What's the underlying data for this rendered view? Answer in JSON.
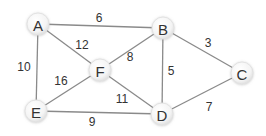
{
  "graph": {
    "type": "undirected-weighted",
    "nodes": [
      {
        "id": "A",
        "label": "A",
        "x": 38,
        "y": 24
      },
      {
        "id": "B",
        "label": "B",
        "x": 163,
        "y": 28
      },
      {
        "id": "C",
        "label": "C",
        "x": 242,
        "y": 73
      },
      {
        "id": "D",
        "label": "D",
        "x": 162,
        "y": 114
      },
      {
        "id": "E",
        "label": "E",
        "x": 36,
        "y": 111
      },
      {
        "id": "F",
        "label": "F",
        "x": 100,
        "y": 70
      }
    ],
    "edges": [
      {
        "from": "A",
        "to": "B",
        "weight": "6",
        "lx": 99,
        "ly": 18
      },
      {
        "from": "A",
        "to": "F",
        "weight": "12",
        "lx": 82,
        "ly": 45
      },
      {
        "from": "A",
        "to": "E",
        "weight": "10",
        "lx": 24,
        "ly": 67
      },
      {
        "from": "B",
        "to": "F",
        "weight": "8",
        "lx": 130,
        "ly": 57
      },
      {
        "from": "B",
        "to": "C",
        "weight": "3",
        "lx": 208,
        "ly": 43
      },
      {
        "from": "B",
        "to": "D",
        "weight": "5",
        "lx": 171,
        "ly": 71
      },
      {
        "from": "C",
        "to": "D",
        "weight": "7",
        "lx": 209,
        "ly": 107
      },
      {
        "from": "F",
        "to": "E",
        "weight": "16",
        "lx": 61,
        "ly": 81
      },
      {
        "from": "F",
        "to": "D",
        "weight": "11",
        "lx": 122,
        "ly": 99
      },
      {
        "from": "E",
        "to": "D",
        "weight": "9",
        "lx": 92,
        "ly": 122
      }
    ]
  }
}
